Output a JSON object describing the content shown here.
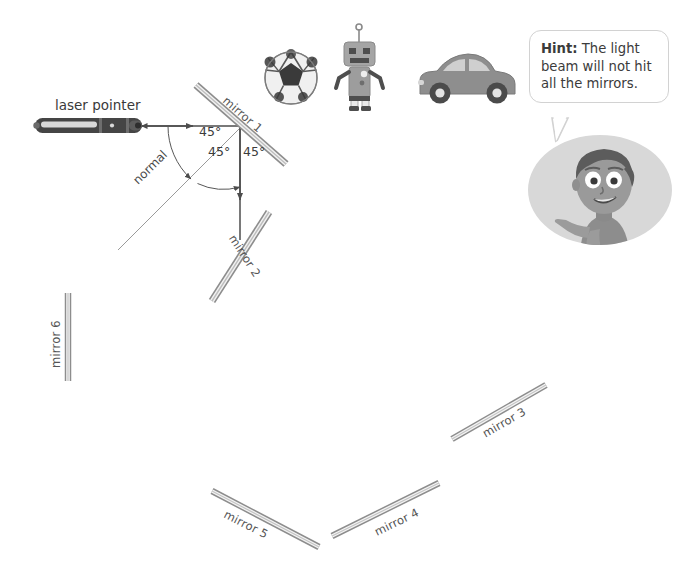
{
  "scene": {
    "title": "laser-mirror-reflection-activity",
    "background_color": "#ffffff"
  },
  "laser": {
    "label": "laser pointer",
    "body_color": "#4a4a4a",
    "stripe_color": "#d9d9d9"
  },
  "beam": {
    "color": "#555555",
    "incoming_label": "",
    "normal_label": "normal"
  },
  "angles": [
    {
      "id": "angle-incidence",
      "text": "45°"
    },
    {
      "id": "angle-reflection",
      "text": "45°"
    },
    {
      "id": "angle-mirror",
      "text": "45°"
    }
  ],
  "mirrors": [
    {
      "id": "mirror-1",
      "label": "mirror 1",
      "x1": 196,
      "y1": 85,
      "x2": 286,
      "y2": 164,
      "label_angle": 41
    },
    {
      "id": "mirror-2",
      "label": "mirror 2",
      "x1": 269,
      "y1": 212,
      "x2": 212,
      "y2": 301,
      "label_angle": 57
    },
    {
      "id": "mirror-3",
      "label": "mirror 3",
      "x1": 452,
      "y1": 439,
      "x2": 546,
      "y2": 385,
      "label_angle": -30
    },
    {
      "id": "mirror-4",
      "label": "mirror 4",
      "x1": 332,
      "y1": 536,
      "x2": 439,
      "y2": 483,
      "label_angle": -26
    },
    {
      "id": "mirror-5",
      "label": "mirror 5",
      "x1": 212,
      "y1": 491,
      "x2": 319,
      "y2": 547,
      "label_angle": 27
    },
    {
      "id": "mirror-6",
      "label": "mirror 6",
      "x1": 68,
      "y1": 293,
      "x2": 68,
      "y2": 381,
      "label_angle": -90
    }
  ],
  "objects": [
    {
      "id": "soccer-ball",
      "name": "soccer ball"
    },
    {
      "id": "robot",
      "name": "robot"
    },
    {
      "id": "car",
      "name": "car"
    }
  ],
  "hint": {
    "prefix": "Hint:",
    "text": " The light beam will not hit all the mirrors.",
    "bubble_border_color": "#d2d2d2"
  },
  "character": {
    "name": "boy-pointing",
    "skin_color": "#9a9a9a",
    "hair_color": "#5a5a5a",
    "shirt_color": "#8d8d8d",
    "oval_color": "#d8d8d8"
  }
}
